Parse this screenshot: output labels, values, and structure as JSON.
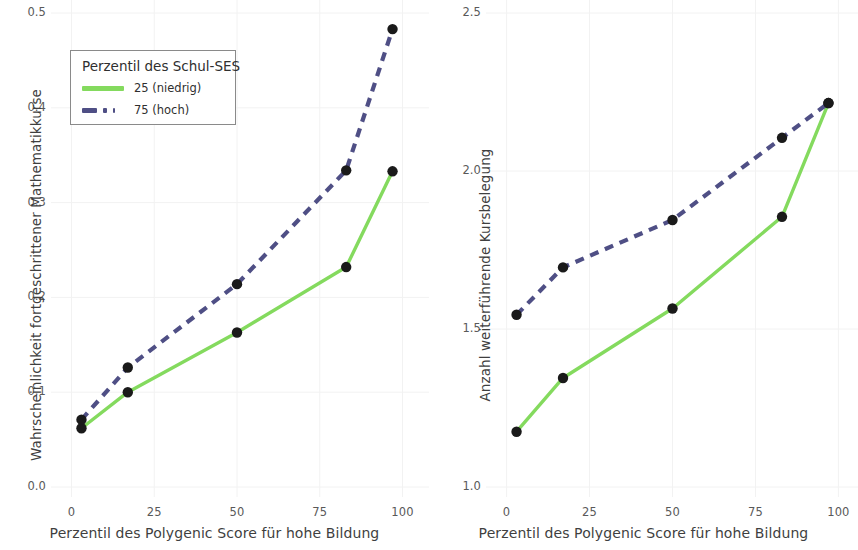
{
  "colors": {
    "low_ses": "#84da5e",
    "high_ses": "#4f4f85",
    "point": "#1a1a1a",
    "tick_text": "#595959",
    "axis_title": "#3f3f3f",
    "background": "#ffffff",
    "grid": "#f2f2f2"
  },
  "legend": {
    "title": "Perzentil des Schul-SES",
    "entries": [
      {
        "label": "25 (niedrig)",
        "color": "#84da5e",
        "style": "solid"
      },
      {
        "label": "75 (hoch)",
        "color": "#4f4f85",
        "style": "dashed"
      }
    ]
  },
  "chart_data": [
    {
      "type": "line",
      "panel": "left",
      "title": "",
      "xlabel": "Perzentil des Polygenic Score für hohe Bildung",
      "ylabel": "Wahrscheinlichkeit fortgeschrittener Mathematikkurse",
      "xlim": [
        -5,
        105
      ],
      "ylim": [
        0.0,
        0.5
      ],
      "xticks": [
        0,
        25,
        50,
        75,
        100
      ],
      "xticklabels": [
        "0",
        "25",
        "50",
        "75",
        "100"
      ],
      "yticks": [
        0.0,
        0.1,
        0.2,
        0.3,
        0.4,
        0.5
      ],
      "yticklabels": [
        "0.0",
        "0.1",
        "0.2",
        "0.3",
        "0.4",
        "0.5"
      ],
      "grid": true,
      "legend_position": "upper left",
      "x": [
        3,
        17,
        50,
        83,
        97
      ],
      "series": [
        {
          "name": "25 (niedrig)",
          "color": "#84da5e",
          "style": "solid",
          "values": [
            0.062,
            0.1,
            0.163,
            0.232,
            0.333
          ]
        },
        {
          "name": "75 (hoch)",
          "color": "#4f4f85",
          "style": "dashed",
          "values": [
            0.071,
            0.126,
            0.214,
            0.334,
            0.483
          ]
        }
      ]
    },
    {
      "type": "line",
      "panel": "right",
      "title": "",
      "xlabel": "Perzentil des Polygenic Score für hohe Bildung",
      "ylabel": "Anzahl weiterführende Kursbelegung",
      "xlim": [
        -5,
        105
      ],
      "ylim": [
        1.0,
        2.5
      ],
      "xticks": [
        0,
        25,
        50,
        75,
        100
      ],
      "xticklabels": [
        "0",
        "25",
        "50",
        "75",
        "100"
      ],
      "yticks": [
        1.0,
        1.5,
        2.0,
        2.5
      ],
      "yticklabels": [
        "1.0",
        "1.5",
        "2.0",
        "2.5"
      ],
      "grid": true,
      "legend_position": "none",
      "x": [
        3,
        17,
        50,
        83,
        97
      ],
      "series": [
        {
          "name": "25 (niedrig)",
          "color": "#84da5e",
          "style": "solid",
          "values": [
            1.175,
            1.345,
            1.565,
            1.855,
            2.215
          ]
        },
        {
          "name": "75 (hoch)",
          "color": "#4f4f85",
          "style": "dashed",
          "values": [
            1.545,
            1.695,
            1.845,
            2.105,
            2.215
          ]
        }
      ]
    }
  ]
}
